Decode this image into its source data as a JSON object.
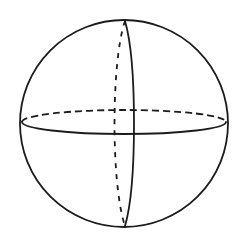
{
  "figure": {
    "kind": "geometry-diagram",
    "background_color": "#ffffff",
    "line_color": "#1c1c1c",
    "stroke_width": 1.8,
    "canvas": {
      "width": 249,
      "height": 240
    },
    "outline": {
      "name": "sphere-outline",
      "shape": "circle",
      "center_x": 124,
      "center_y": 123.5,
      "radius": 104,
      "style": "solid"
    },
    "equator": {
      "name": "equator-great-circle",
      "shape": "ellipse",
      "center_x": 124,
      "center_y": 122,
      "radius_x": 102,
      "radius_y": 12,
      "front_style": "solid",
      "back_style": "dashed",
      "dash_pattern": "7 4",
      "left_node_x": 22,
      "left_node_y": 122,
      "right_node_x": 226,
      "right_node_y": 122
    },
    "meridian_front": {
      "name": "front-meridian",
      "shape": "ellipse-arc",
      "style": "solid",
      "top_pole_x": 125,
      "top_pole_y": 21,
      "bottom_pole_x": 125,
      "bottom_pole_y": 226,
      "bulge_x": 137,
      "bulge_direction": "right"
    },
    "meridian_back": {
      "name": "back-meridian",
      "shape": "ellipse-arc",
      "style": "dashed",
      "dash_pattern": "5 6",
      "top_pole_x": 125,
      "top_pole_y": 21,
      "bottom_pole_x": 125,
      "bottom_pole_y": 226,
      "bulge_x": 111,
      "bulge_direction": "left"
    },
    "poles": {
      "north_label": "",
      "south_label": ""
    },
    "labels": []
  }
}
